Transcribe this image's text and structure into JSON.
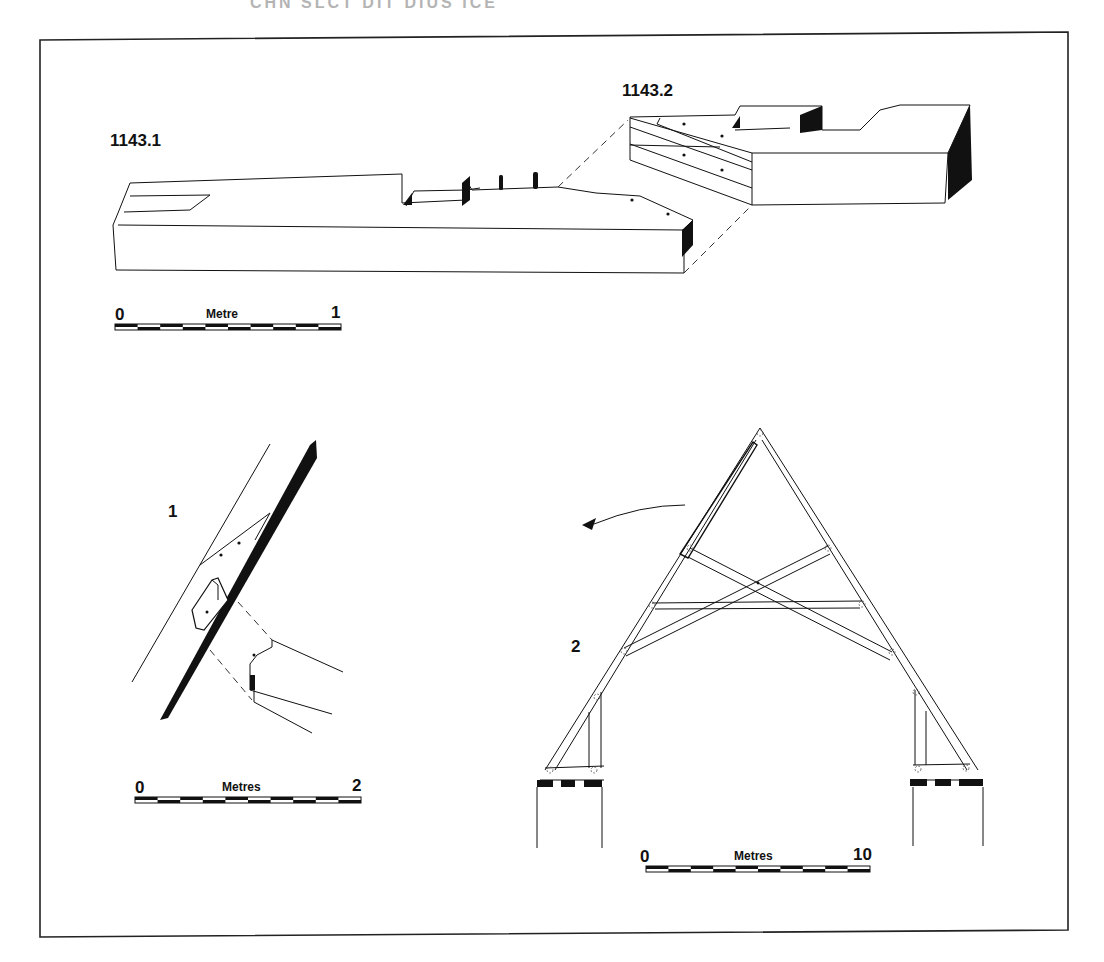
{
  "header": {
    "fragment_text": "CHN  SLCT  DIT  DIUS  ICE"
  },
  "figure": {
    "frame": {
      "stroke": "#222222"
    },
    "top": {
      "label_1": "1143.1",
      "label_2": "1143.2",
      "scale": {
        "start": "0",
        "title": "Metre",
        "end": "1",
        "segments": 10
      }
    },
    "left": {
      "label": "1",
      "scale": {
        "start": "0",
        "title": "Metres",
        "end": "2",
        "segments": 10
      }
    },
    "right": {
      "label": "2",
      "scale": {
        "start": "0",
        "title": "Metres",
        "end": "10",
        "segments": 10
      }
    }
  },
  "colors": {
    "ink": "#111111",
    "paper": "#ffffff"
  }
}
